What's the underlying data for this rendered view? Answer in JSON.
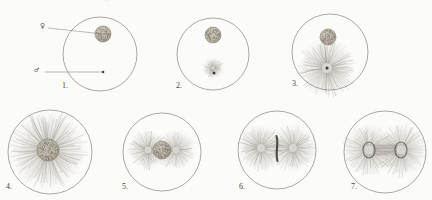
{
  "plate": {
    "title": "Fertilization and early cleavage figures",
    "medium": "engraved line illustration, sepia on aged paper",
    "background_color": "#fbfbfa",
    "ink_color": "#6d665a",
    "dark_ink_color": "#2e2a24",
    "panel_count": 7
  },
  "labels": {
    "female_symbol": "♀",
    "male_symbol": "♂",
    "female_symbol_name": "venus-symbol",
    "male_symbol_name": "mars-symbol"
  },
  "figures": [
    {
      "number": "1.",
      "name": "figure-1",
      "caption": "Egg with female pronucleus and sperm entry point",
      "cell_center": [
        100,
        54
      ],
      "cell_radius": 37,
      "nucleus": {
        "cx": 103,
        "cy": 34,
        "r": 8
      },
      "sperm_dot": [
        103,
        72
      ],
      "aster": null
    },
    {
      "number": "2.",
      "name": "figure-2",
      "caption": "Sperm aster forming below the female pronucleus",
      "cell_center": [
        213,
        54
      ],
      "cell_radius": 36,
      "nucleus": {
        "cx": 213,
        "cy": 35,
        "r": 8
      },
      "sperm_dot": [
        214,
        73
      ],
      "aster": {
        "cx": 213,
        "cy": 68,
        "r": 11,
        "rays": 40
      }
    },
    {
      "number": "3.",
      "name": "figure-3",
      "caption": "Enlarged sperm aster with long radiating rays",
      "cell_center": [
        330,
        52
      ],
      "cell_radius": 38,
      "nucleus": {
        "cx": 328,
        "cy": 37,
        "r": 8
      },
      "sperm_dot": [
        327,
        68
      ],
      "aster": {
        "cx": 327,
        "cy": 68,
        "r": 31,
        "rays": 80
      }
    },
    {
      "number": "4.",
      "name": "figure-4",
      "caption": "Monaster stage, rays filling the whole egg",
      "cell_center": [
        50,
        152
      ],
      "cell_radius": 42,
      "nucleus": {
        "cx": 48,
        "cy": 150,
        "r": 11
      },
      "sperm_dot": null,
      "aster": {
        "cx": 48,
        "cy": 150,
        "r": 41,
        "rays": 120
      }
    },
    {
      "number": "5.",
      "name": "figure-5",
      "caption": "Diaster: two asters flanking the central chromatin mass",
      "cell_center": [
        162,
        152
      ],
      "cell_radius": 39,
      "nucleus": {
        "cx": 162,
        "cy": 150,
        "r": 9
      },
      "sperm_dot": null,
      "aster": {
        "cx": 162,
        "cy": 150,
        "r": 21,
        "rays": 54
      }
    },
    {
      "number": "6.",
      "name": "figure-6",
      "caption": "Metaphase: equatorial chromosome plate between two asters",
      "cell_center": [
        277,
        150
      ],
      "cell_radius": 39,
      "nucleus": null,
      "sperm_dot": null,
      "aster": {
        "cx": 277,
        "cy": 148,
        "r": 25,
        "rays": 62
      }
    },
    {
      "number": "7.",
      "name": "figure-7",
      "caption": "Anaphase: daughter asters joined by the spindle bridge",
      "cell_center": [
        385,
        152
      ],
      "cell_radius": 41,
      "nucleus": null,
      "sperm_dot": null,
      "aster": {
        "cx": 385,
        "cy": 150,
        "r": 28,
        "rays": 70
      }
    }
  ],
  "leaders": [
    {
      "name": "female-leader-line",
      "from": [
        48,
        28
      ],
      "to": [
        103,
        34
      ],
      "points_to": "female pronucleus of figure 1"
    },
    {
      "name": "male-leader-line",
      "from": [
        45,
        72
      ],
      "to": [
        103,
        72
      ],
      "points_to": "sperm entry dot of figure 1"
    }
  ]
}
